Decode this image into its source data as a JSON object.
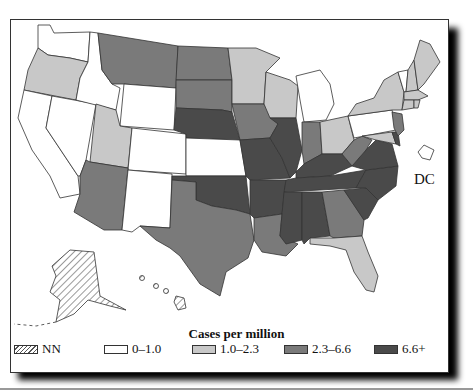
{
  "legend": {
    "title": "Cases per million",
    "items": [
      {
        "label": "NN",
        "fill": "hatch"
      },
      {
        "label": "0–1.0",
        "fill": "#ffffff"
      },
      {
        "label": "1.0–2.3",
        "fill": "#c8c8c8"
      },
      {
        "label": "2.3–6.6",
        "fill": "#7a7a7a"
      },
      {
        "label": "6.6+",
        "fill": "#4a4a4a"
      }
    ]
  },
  "dc_label": "DC",
  "colors": {
    "cat_nn": "hatch",
    "cat_0_1": "#ffffff",
    "cat_1_2": "#c8c8c8",
    "cat_2_6": "#7a7a7a",
    "cat_6p": "#4a4a4a",
    "stroke": "#333333"
  },
  "states": {
    "NN": [
      "AK",
      "HI"
    ],
    "0-1.0": [
      "WA",
      "ID",
      "WY",
      "CA",
      "NV",
      "CO",
      "NM",
      "KS",
      "MI",
      "PA",
      "VT",
      "DC"
    ],
    "1.0-2.3": [
      "OR",
      "UT",
      "MN",
      "WI",
      "OH",
      "NY",
      "ME",
      "NH",
      "MA",
      "CT",
      "RI",
      "FL",
      "MD"
    ],
    "2.3-6.6": [
      "MT",
      "ND",
      "SD",
      "IA",
      "AZ",
      "TX",
      "LA",
      "GA",
      "IN",
      "WV",
      "NJ"
    ],
    "6.6+": [
      "NE",
      "MO",
      "IL",
      "KY",
      "TN",
      "AR",
      "OK",
      "MS",
      "AL",
      "VA",
      "NC",
      "SC",
      "DE"
    ]
  }
}
